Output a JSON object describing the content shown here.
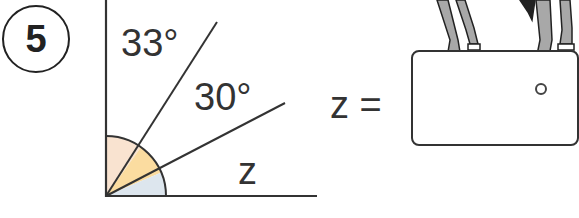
{
  "question": {
    "number": "5"
  },
  "diagram": {
    "angles": [
      {
        "label": "33°",
        "color": "#f9e3d0"
      },
      {
        "label": "30°",
        "color": "#fbdca0"
      },
      {
        "label": "z",
        "color": "#dde6ee"
      }
    ],
    "total_angle": "90°"
  },
  "equation": {
    "lhs": "z =",
    "answer_value": "",
    "unit_hint": "o"
  },
  "illustration": {
    "subject": "horse legs standing on answer box"
  }
}
